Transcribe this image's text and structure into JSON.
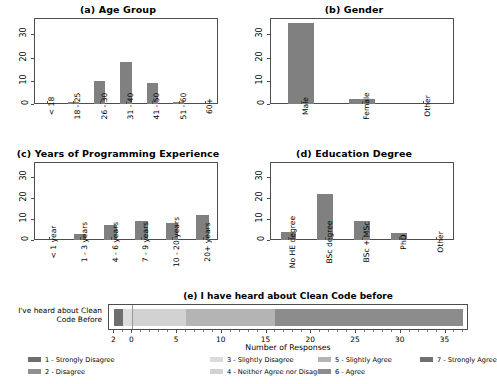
{
  "chart_data": [
    {
      "type": "bar",
      "title": "(a) Age Group",
      "panel": "a",
      "xlabel": "",
      "ylabel": "",
      "categories": [
        "< 18",
        "18 - 25",
        "26 - 30",
        "31 - 40",
        "41 - 50",
        "51 - 60",
        "60+"
      ],
      "values": [
        0,
        1,
        10,
        18,
        9,
        1,
        0
      ],
      "yticks": [
        "0",
        "10",
        "20",
        "30"
      ],
      "ylim": [
        0,
        37
      ],
      "grid": false,
      "bar_color": "#808080"
    },
    {
      "type": "bar",
      "title": "(b) Gender",
      "panel": "b",
      "xlabel": "",
      "ylabel": "",
      "categories": [
        "Male",
        "Female",
        "Other"
      ],
      "values": [
        35,
        2,
        0
      ],
      "yticks": [
        "0",
        "10",
        "20",
        "30"
      ],
      "ylim": [
        0,
        37
      ],
      "grid": false,
      "bar_color": "#808080"
    },
    {
      "type": "bar",
      "title": "(c) Years of Programming Experience",
      "panel": "c",
      "xlabel": "",
      "ylabel": "",
      "categories": [
        "< 1 year",
        "1 - 3 years",
        "4 - 6 years",
        "7 - 9 years",
        "10 - 20 years",
        "20+ years"
      ],
      "values": [
        0,
        3,
        7,
        9,
        8,
        12
      ],
      "yticks": [
        "0",
        "10",
        "20",
        "30"
      ],
      "ylim": [
        0,
        37
      ],
      "grid": false,
      "bar_color": "#808080"
    },
    {
      "type": "bar",
      "title": "(d) Education Degree",
      "panel": "d",
      "xlabel": "",
      "ylabel": "",
      "categories": [
        "No HE degree",
        "BSc degree",
        "BSc + MSc",
        "PhD",
        "Other"
      ],
      "values": [
        4,
        22,
        9,
        3.5,
        0
      ],
      "yticks": [
        "0",
        "10",
        "20",
        "30"
      ],
      "ylim": [
        0,
        37
      ],
      "grid": false,
      "bar_color": "#808080"
    },
    {
      "type": "bar",
      "title": "(e) I have heard about Clean Code before",
      "panel": "e",
      "orientation": "horizontal",
      "stacked": "diverging",
      "xlabel": "Number of Responses",
      "ylabel": "",
      "categories": [
        "I've heard about Clean Code Before"
      ],
      "xticks": [
        "2",
        "0",
        "5",
        "10",
        "15",
        "20",
        "25",
        "30",
        "35"
      ],
      "xtick_values": [
        -2,
        0,
        5,
        10,
        15,
        20,
        25,
        30,
        35
      ],
      "xlim": [
        -2.6,
        37.4
      ],
      "grid": false,
      "series": [
        {
          "name": "1 - Strongly Disagree",
          "values": [
            1
          ],
          "color": "#6e6e6e",
          "start": -2,
          "end": -1
        },
        {
          "name": "2 - Disagree",
          "values": [
            0
          ],
          "color": "#8f8f8f",
          "start": -1,
          "end": -1
        },
        {
          "name": "3 - Slightly Disagree",
          "values": [
            1
          ],
          "color": "#dcdcdc",
          "start": -1,
          "end": 0
        },
        {
          "name": "4 - Neither Agree nor Disagree",
          "values": [
            6
          ],
          "color": "#d2d2d2",
          "start": 0,
          "end": 6
        },
        {
          "name": "5 - Slightly Agree",
          "values": [
            10
          ],
          "color": "#b4b4b4",
          "start": 6,
          "end": 16
        },
        {
          "name": "6 - Agree",
          "values": [
            21
          ],
          "color": "#8c8c8c",
          "start": 16,
          "end": 37
        },
        {
          "name": "7 - Strongly Agree",
          "values": [
            0
          ],
          "color": "#707070",
          "start": 37,
          "end": 37
        }
      ],
      "legend": {
        "position": "bottom",
        "columns": [
          [
            "1 - Strongly Disagree",
            "2 - Disagree"
          ],
          [
            "3 - Slightly Disagree",
            "4 - Neither Agree nor Disagree"
          ],
          [
            "5 - Slightly Agree",
            "6 - Agree"
          ],
          [
            "7 - Strongly Agree"
          ]
        ],
        "colors": [
          [
            "#6e6e6e",
            "#8f8f8f"
          ],
          [
            "#dcdcdc",
            "#d2d2d2"
          ],
          [
            "#b4b4b4",
            "#8c8c8c"
          ],
          [
            "#707070"
          ]
        ]
      }
    }
  ]
}
